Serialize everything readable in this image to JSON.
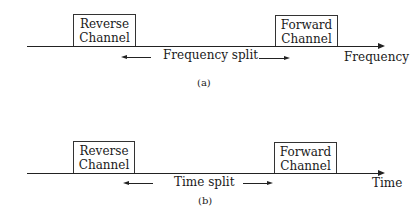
{
  "panels": [
    {
      "id": "a",
      "left_box": {
        "line1": "Reverse",
        "line2": "Channel"
      },
      "right_box": {
        "line1": "Forward",
        "line2": "Channel"
      },
      "split_label": "Frequency split",
      "axis_label": "Frequency",
      "caption": "(a)"
    },
    {
      "id": "b",
      "left_box": {
        "line1": "Reverse",
        "line2": "Channel"
      },
      "right_box": {
        "line1": "Forward",
        "line2": "Channel"
      },
      "split_label": "Time split",
      "axis_label": "Time",
      "caption": "(b)"
    }
  ]
}
